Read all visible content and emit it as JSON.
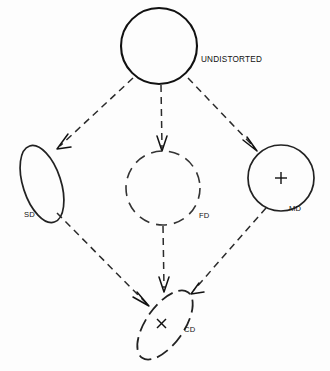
{
  "figure": {
    "background_color": "#fdfdfd",
    "stroke_color": "#111111",
    "width": 330,
    "height": 371
  },
  "nodes": {
    "undistorted": {
      "label": "UNDISTORTED",
      "shape": "circle",
      "outline": "solid",
      "center_x": 159,
      "center_y": 46,
      "radius": 38,
      "marker": "",
      "label_x": 201,
      "label_y": 62
    },
    "sd": {
      "label": "SD",
      "shape": "ellipse",
      "outline": "solid",
      "center_x": 42,
      "center_y": 184,
      "radius_x": 19,
      "radius_y": 40,
      "rotation": -18,
      "marker": "",
      "label_x": 24,
      "label_y": 217
    },
    "fd": {
      "label": "FD",
      "shape": "circle",
      "outline": "dashed",
      "center_x": 163,
      "center_y": 188,
      "radius": 37,
      "marker": "",
      "label_x": 199,
      "label_y": 218
    },
    "md": {
      "label": "MD",
      "shape": "circle",
      "outline": "solid",
      "center_x": 281,
      "center_y": 178,
      "radius": 33,
      "marker": "+",
      "label_x": 289,
      "label_y": 211
    },
    "cd": {
      "label": "CD",
      "shape": "ellipse",
      "outline": "dashed",
      "center_x": 165,
      "center_y": 325,
      "radius_x": 19,
      "radius_y": 40,
      "rotation": 35,
      "marker": "x",
      "label_x": 184,
      "label_y": 332
    }
  },
  "edges": [
    {
      "name": "undistorted-to-sd",
      "from": "undistorted",
      "to": "sd",
      "style": "dashed",
      "arrow": true
    },
    {
      "name": "undistorted-to-fd",
      "from": "undistorted",
      "to": "fd",
      "style": "dashed",
      "arrow": true
    },
    {
      "name": "undistorted-to-md",
      "from": "undistorted",
      "to": "md",
      "style": "dashed",
      "arrow": true
    },
    {
      "name": "sd-to-cd",
      "from": "sd",
      "to": "cd",
      "style": "dashed",
      "arrow": true
    },
    {
      "name": "fd-to-cd",
      "from": "fd",
      "to": "cd",
      "style": "dashed",
      "arrow": true
    },
    {
      "name": "md-to-cd",
      "from": "md",
      "to": "cd",
      "style": "dashed",
      "arrow": true
    }
  ]
}
